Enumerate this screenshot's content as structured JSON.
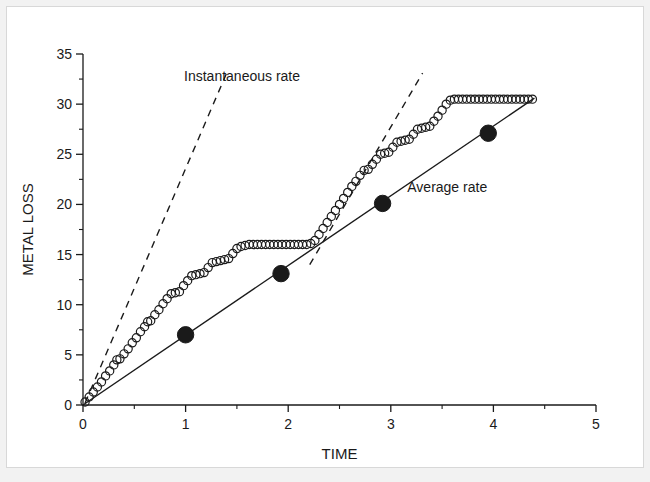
{
  "chart_data": {
    "type": "scatter",
    "title": "",
    "xlabel": "TIME",
    "ylabel": "METAL LOSS",
    "xlim": [
      0,
      5
    ],
    "ylim": [
      0,
      35
    ],
    "grid": false,
    "legend_position": "inline-annotations",
    "x_ticks": [
      0,
      1,
      2,
      3,
      4,
      5
    ],
    "x_tick_labels": [
      "0",
      "1",
      "2",
      "3",
      "4",
      "5"
    ],
    "x_minor_ticks": [
      0.5,
      1.5,
      2.5,
      3.5,
      4.5
    ],
    "y_ticks": [
      0,
      5,
      10,
      15,
      20,
      25,
      30,
      35
    ],
    "y_tick_labels": [
      "0",
      "5",
      "10",
      "15",
      "20",
      "25",
      "30",
      "35"
    ],
    "y_minor_ticks": [
      2.5,
      7.5,
      12.5,
      17.5,
      22.5,
      27.5,
      32.5
    ],
    "annotations": [
      {
        "text": "Instantaneous rate",
        "x": 1.55,
        "y": 32.3
      },
      {
        "text": "Average rate",
        "x": 3.55,
        "y": 21.2
      }
    ],
    "series": [
      {
        "name": "Metal loss (measured)",
        "marker": "open-circle",
        "color": "#1a1a1a",
        "points": [
          [
            0.02,
            0.3
          ],
          [
            0.06,
            0.8
          ],
          [
            0.1,
            1.3
          ],
          [
            0.14,
            1.8
          ],
          [
            0.18,
            2.3
          ],
          [
            0.22,
            2.9
          ],
          [
            0.26,
            3.4
          ],
          [
            0.3,
            4.0
          ],
          [
            0.33,
            4.5
          ],
          [
            0.36,
            4.6
          ],
          [
            0.4,
            5.1
          ],
          [
            0.44,
            5.6
          ],
          [
            0.48,
            6.2
          ],
          [
            0.52,
            6.7
          ],
          [
            0.56,
            7.3
          ],
          [
            0.6,
            7.8
          ],
          [
            0.63,
            8.3
          ],
          [
            0.66,
            8.4
          ],
          [
            0.7,
            9.0
          ],
          [
            0.74,
            9.5
          ],
          [
            0.78,
            10.1
          ],
          [
            0.82,
            10.6
          ],
          [
            0.86,
            11.1
          ],
          [
            0.9,
            11.2
          ],
          [
            0.94,
            11.3
          ],
          [
            0.98,
            11.9
          ],
          [
            1.02,
            12.4
          ],
          [
            1.06,
            12.9
          ],
          [
            1.1,
            13.0
          ],
          [
            1.14,
            13.1
          ],
          [
            1.18,
            13.2
          ],
          [
            1.22,
            13.7
          ],
          [
            1.26,
            14.2
          ],
          [
            1.3,
            14.3
          ],
          [
            1.34,
            14.4
          ],
          [
            1.38,
            14.5
          ],
          [
            1.42,
            14.6
          ],
          [
            1.46,
            15.1
          ],
          [
            1.5,
            15.6
          ],
          [
            1.54,
            15.8
          ],
          [
            1.58,
            15.9
          ],
          [
            1.62,
            16.0
          ],
          [
            1.66,
            16.0
          ],
          [
            1.7,
            16.0
          ],
          [
            1.74,
            16.0
          ],
          [
            1.78,
            16.0
          ],
          [
            1.82,
            16.0
          ],
          [
            1.86,
            16.0
          ],
          [
            1.9,
            16.0
          ],
          [
            1.94,
            16.0
          ],
          [
            1.98,
            16.0
          ],
          [
            2.02,
            16.0
          ],
          [
            2.06,
            16.0
          ],
          [
            2.1,
            16.0
          ],
          [
            2.14,
            16.0
          ],
          [
            2.18,
            16.0
          ],
          [
            2.22,
            16.1
          ],
          [
            2.26,
            16.4
          ],
          [
            2.3,
            17.0
          ],
          [
            2.34,
            17.6
          ],
          [
            2.38,
            18.2
          ],
          [
            2.42,
            18.8
          ],
          [
            2.46,
            19.4
          ],
          [
            2.5,
            20.0
          ],
          [
            2.54,
            20.6
          ],
          [
            2.58,
            21.2
          ],
          [
            2.62,
            21.8
          ],
          [
            2.66,
            22.3
          ],
          [
            2.7,
            22.9
          ],
          [
            2.74,
            23.4
          ],
          [
            2.78,
            23.5
          ],
          [
            2.82,
            24.0
          ],
          [
            2.86,
            24.5
          ],
          [
            2.9,
            25.0
          ],
          [
            2.94,
            25.1
          ],
          [
            2.98,
            25.2
          ],
          [
            3.02,
            25.7
          ],
          [
            3.06,
            26.2
          ],
          [
            3.1,
            26.3
          ],
          [
            3.14,
            26.4
          ],
          [
            3.18,
            26.5
          ],
          [
            3.22,
            27.0
          ],
          [
            3.26,
            27.5
          ],
          [
            3.3,
            27.6
          ],
          [
            3.34,
            27.7
          ],
          [
            3.38,
            27.8
          ],
          [
            3.42,
            28.3
          ],
          [
            3.46,
            28.8
          ],
          [
            3.5,
            29.4
          ],
          [
            3.54,
            30.0
          ],
          [
            3.58,
            30.4
          ],
          [
            3.62,
            30.5
          ],
          [
            3.66,
            30.5
          ],
          [
            3.7,
            30.5
          ],
          [
            3.74,
            30.5
          ],
          [
            3.78,
            30.5
          ],
          [
            3.82,
            30.5
          ],
          [
            3.86,
            30.5
          ],
          [
            3.9,
            30.5
          ],
          [
            3.94,
            30.5
          ],
          [
            3.98,
            30.5
          ],
          [
            4.02,
            30.5
          ],
          [
            4.06,
            30.5
          ],
          [
            4.1,
            30.5
          ],
          [
            4.14,
            30.5
          ],
          [
            4.18,
            30.5
          ],
          [
            4.22,
            30.5
          ],
          [
            4.26,
            30.5
          ],
          [
            4.3,
            30.5
          ],
          [
            4.34,
            30.5
          ],
          [
            4.38,
            30.5
          ]
        ]
      },
      {
        "name": "Average rate",
        "marker": "filled-circle",
        "line": "solid",
        "color": "#1a1a1a",
        "points": [
          [
            1.0,
            7.0
          ],
          [
            1.93,
            13.1
          ],
          [
            2.92,
            20.1
          ],
          [
            3.95,
            27.1
          ]
        ],
        "line_from": [
          0.0,
          0.0
        ],
        "line_to": [
          4.4,
          30.6
        ]
      },
      {
        "name": "Instantaneous rate (tangent 1)",
        "marker": "none",
        "line": "dashed",
        "color": "#1a1a1a",
        "line_from": [
          0.02,
          0.2
        ],
        "line_to": [
          1.4,
          33.1
        ]
      },
      {
        "name": "Instantaneous rate (tangent 2)",
        "marker": "none",
        "line": "dashed",
        "color": "#1a1a1a",
        "line_from": [
          2.21,
          14.0
        ],
        "line_to": [
          3.31,
          33.1
        ]
      }
    ]
  }
}
